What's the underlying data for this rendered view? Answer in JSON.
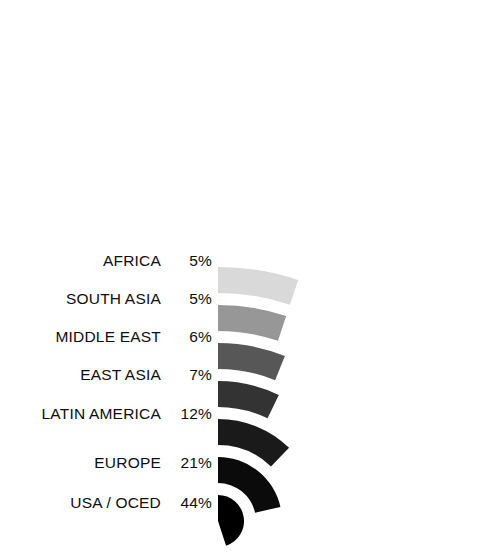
{
  "chart_data": {
    "type": "bar",
    "subtype": "radial-bar",
    "title": "",
    "subtitle": "",
    "xlabel": "",
    "ylabel": "",
    "grid": false,
    "legend": "none",
    "value_suffix": "%",
    "value_range": [
      0,
      44
    ],
    "categories": [
      "AFRICA",
      "SOUTH ASIA",
      "MIDDLE EAST",
      "EAST ASIA",
      "LATIN AMERICA",
      "EUROPE",
      "USA / OCED"
    ],
    "values": [
      5,
      5,
      6,
      7,
      12,
      21,
      44
    ],
    "value_labels": [
      "5%",
      "5%",
      "6%",
      "7%",
      "12%",
      "21%",
      "44%"
    ],
    "colors": [
      "#d9d9d9",
      "#979797",
      "#575757",
      "#333333",
      "#1a1a1a",
      "#0b0b0b",
      "#000000"
    ],
    "series": [
      {
        "name": "share",
        "values": [
          5,
          5,
          6,
          7,
          12,
          21,
          44
        ]
      }
    ],
    "points": [
      {
        "category": "AFRICA",
        "value": 5,
        "label": "5%",
        "color": "#d9d9d9"
      },
      {
        "category": "SOUTH ASIA",
        "value": 5,
        "label": "5%",
        "color": "#979797"
      },
      {
        "category": "MIDDLE EAST",
        "value": 6,
        "label": "6%",
        "color": "#575757"
      },
      {
        "category": "EAST ASIA",
        "value": 7,
        "label": "7%",
        "color": "#333333"
      },
      {
        "category": "LATIN AMERICA",
        "value": 12,
        "label": "12%",
        "color": "#1a1a1a"
      },
      {
        "category": "EUROPE",
        "value": 21,
        "label": "21%",
        "color": "#0b0b0b"
      },
      {
        "category": "USA / OCED",
        "value": 44,
        "label": "44%",
        "color": "#000000"
      }
    ]
  },
  "geometry": {
    "center_x": 218,
    "center_y": 521,
    "band_thickness": 26,
    "band_gap": 12,
    "inner_radius_first": 0,
    "max_sweep_degrees": 162,
    "degrees_per_percent": 3.68,
    "background": "#ffffff"
  },
  "labels": {
    "label_right_edge": 212,
    "rows": [
      {
        "name": "AFRICA",
        "value": "5%",
        "y": 263
      },
      {
        "name": "SOUTH ASIA",
        "value": "5%",
        "y": 301
      },
      {
        "name": "MIDDLE EAST",
        "value": "6%",
        "y": 339
      },
      {
        "name": "EAST ASIA",
        "value": "7%",
        "y": 377
      },
      {
        "name": "LATIN AMERICA",
        "value": "12%",
        "y": 416
      },
      {
        "name": "EUROPE",
        "value": "21%",
        "y": 465
      },
      {
        "name": "USA / OCED",
        "value": "44%",
        "y": 505
      }
    ]
  }
}
